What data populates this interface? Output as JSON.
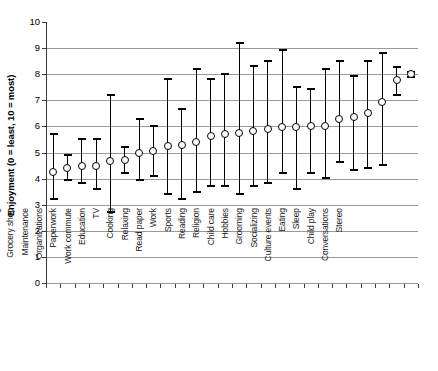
{
  "chart_data": {
    "type": "scatter",
    "title": "",
    "xlabel": "",
    "ylabel": "Enjoyment (0 = least, 10 = most)",
    "ylim": [
      0,
      10
    ],
    "ytick_labels": [
      "0",
      "1",
      "2",
      "3",
      "4",
      "5",
      "6",
      "7",
      "8",
      "9",
      "10"
    ],
    "yticks": [
      0,
      1,
      2,
      3,
      4,
      5,
      6,
      7,
      8,
      9,
      10
    ],
    "grid": "horizontal",
    "legend": "none",
    "marker": "open-circle",
    "error_bar_style": "capped-vertical-range",
    "categories": [
      "Other shopping",
      "Cleaning",
      "Grocery shop",
      "Maintenance",
      "Organizations",
      "Paperwork",
      "Work commute",
      "Education",
      "TV",
      "Cooking",
      "Relaxing",
      "Read paper",
      "Work",
      "Sports",
      "Reading",
      "Religion",
      "Child care",
      "Hobbies",
      "Grooming",
      "Socializing",
      "Culture events",
      "Eating",
      "Sleep",
      "Child play",
      "Conversations",
      "Stereo"
    ],
    "values": [
      4.25,
      4.4,
      4.5,
      4.5,
      4.67,
      4.7,
      5.0,
      5.05,
      5.25,
      5.3,
      5.4,
      5.65,
      5.72,
      5.75,
      5.82,
      5.9,
      5.97,
      5.97,
      6.0,
      6.0,
      6.3,
      6.35,
      6.52,
      6.92,
      7.78,
      8.0
    ],
    "error_low": [
      3.2,
      3.93,
      3.82,
      3.6,
      2.72,
      4.2,
      3.93,
      4.1,
      3.4,
      3.22,
      3.5,
      3.7,
      3.7,
      3.42,
      3.7,
      3.83,
      4.22,
      3.6,
      4.22,
      4.02,
      4.62,
      4.32,
      4.42,
      4.52,
      7.22,
      7.9
    ],
    "error_high": [
      5.72,
      4.92,
      5.52,
      5.52,
      7.2,
      5.2,
      6.3,
      6.02,
      7.8,
      6.65,
      8.2,
      7.8,
      8.02,
      9.2,
      8.3,
      8.5,
      8.92,
      7.5,
      7.42,
      8.2,
      8.5,
      7.92,
      8.5,
      8.82,
      8.28,
      8.1
    ]
  }
}
